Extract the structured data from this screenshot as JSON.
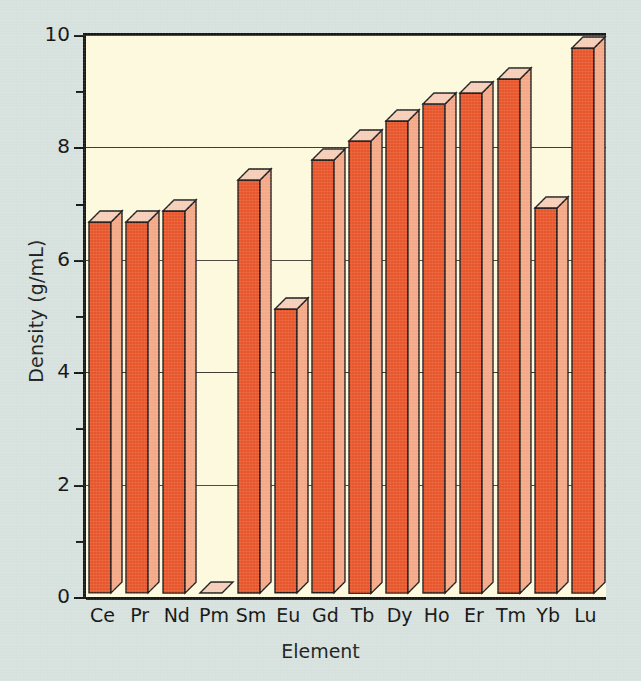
{
  "chart_data": {
    "type": "bar",
    "title": "",
    "subtitle": "",
    "xlabel": "Element",
    "ylabel": "Density (g/mL)",
    "categories": [
      "Ce",
      "Pr",
      "Nd",
      "Pm",
      "Sm",
      "Eu",
      "Gd",
      "Tb",
      "Dy",
      "Ho",
      "Er",
      "Tm",
      "Yb",
      "Lu"
    ],
    "values": [
      6.6,
      6.6,
      6.8,
      0,
      7.35,
      5.05,
      7.7,
      8.05,
      8.4,
      8.7,
      8.9,
      9.15,
      6.85,
      9.7
    ],
    "ylim": [
      0,
      10
    ],
    "y_major_ticks": [
      0,
      2,
      4,
      6,
      8,
      10
    ],
    "y_minor_ticks": [
      1,
      3,
      5,
      7,
      9
    ],
    "y_tick_labels": [
      "0",
      "2",
      "4",
      "6",
      "8",
      "10"
    ],
    "grid": "horizontal-major-only",
    "legend": "none",
    "style": "3d-bar",
    "colors": {
      "background": "#d6e1dd",
      "plot_background": "#fdf9dd",
      "bar_front": "#e8562c",
      "bar_side": "#f4a886",
      "bar_top": "#f6ceb8",
      "axis": "#161616",
      "gridline": "#3a3a30",
      "text": "#111111"
    }
  },
  "axes": {
    "y_title": "Density (g/mL)",
    "x_title": "Element"
  },
  "ticks": {
    "y": [
      "0",
      "2",
      "4",
      "6",
      "8",
      "10"
    ],
    "x": [
      "Ce",
      "Pr",
      "Nd",
      "Pm",
      "Sm",
      "Eu",
      "Gd",
      "Tb",
      "Dy",
      "Ho",
      "Er",
      "Tm",
      "Yb",
      "Lu"
    ]
  }
}
